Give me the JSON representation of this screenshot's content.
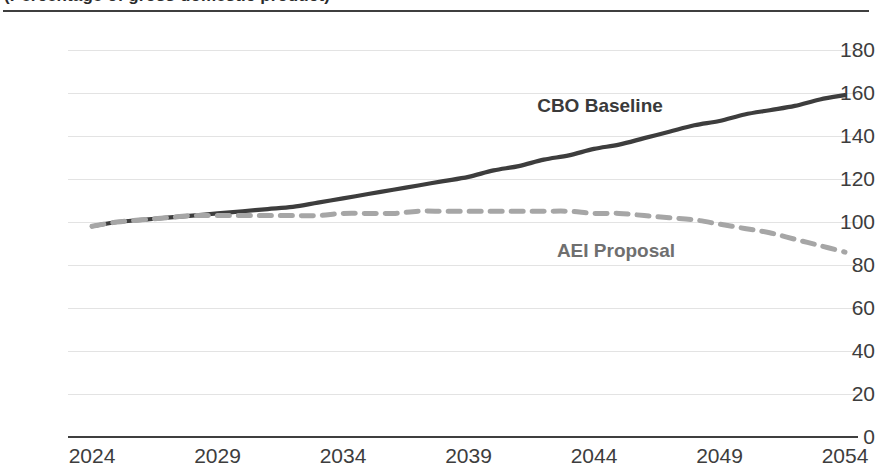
{
  "chart": {
    "title": "(Percentage of gross domestic product)",
    "title_truncated": true
  },
  "axes": {
    "y_ticks": [
      "180",
      "160",
      "140",
      "120",
      "100",
      "80",
      "60",
      "40",
      "20",
      "0"
    ],
    "x_ticks": [
      "2024",
      "2029",
      "2034",
      "2039",
      "2044",
      "2049",
      "2054"
    ],
    "y_label": "",
    "x_label": ""
  },
  "labels": {
    "cbo": "CBO Baseline",
    "aei": "AEI Proposal"
  },
  "colors": {
    "cbo_line": "#3d3d3d",
    "aei_line": "#a6a6a6",
    "gridline": "#e3e3e3",
    "axis": "#3f3f3f",
    "tick_text": "#3d3d3d"
  },
  "chart_data": {
    "type": "line",
    "title": "(Percentage of gross domestic product)",
    "xlabel": "",
    "ylabel": "",
    "xlim": [
      2024,
      2054
    ],
    "ylim": [
      0,
      180
    ],
    "grid": true,
    "legend": "inline-labels",
    "x": [
      2024,
      2025,
      2026,
      2027,
      2028,
      2029,
      2030,
      2031,
      2032,
      2033,
      2034,
      2035,
      2036,
      2037,
      2038,
      2039,
      2040,
      2041,
      2042,
      2043,
      2044,
      2045,
      2046,
      2047,
      2048,
      2049,
      2050,
      2051,
      2052,
      2053,
      2054
    ],
    "series": [
      {
        "name": "CBO Baseline",
        "style": "solid",
        "color": "#3d3d3d",
        "values": [
          98,
          100,
          101,
          102,
          103,
          104,
          105,
          106,
          107,
          109,
          111,
          113,
          115,
          117,
          119,
          121,
          124,
          126,
          129,
          131,
          134,
          136,
          139,
          142,
          145,
          147,
          150,
          152,
          154,
          157,
          159
        ]
      },
      {
        "name": "AEI Proposal",
        "style": "dashed",
        "color": "#a6a6a6",
        "values": [
          98,
          100,
          101,
          102,
          103,
          103,
          103,
          103,
          103,
          103,
          104,
          104,
          104,
          105,
          105,
          105,
          105,
          105,
          105,
          105,
          104,
          104,
          103,
          102,
          101,
          99,
          97,
          95,
          92,
          89,
          86
        ]
      }
    ]
  }
}
